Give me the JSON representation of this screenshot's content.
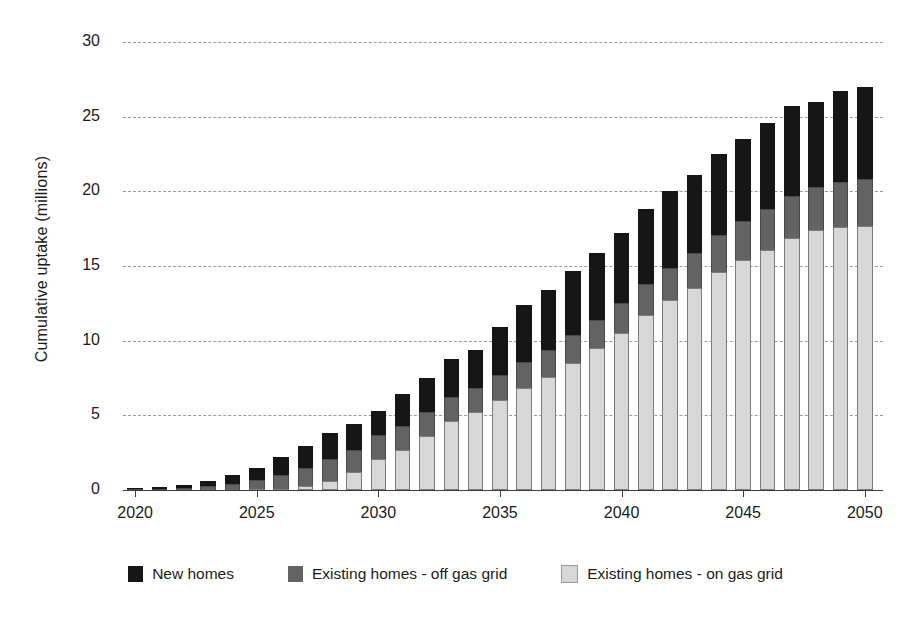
{
  "chart_data": {
    "type": "bar",
    "stacked": true,
    "title": "",
    "xlabel": "",
    "ylabel": "Cumulative uptake (millions)",
    "ylim": [
      0,
      30
    ],
    "ytick_step": 5,
    "yticks": [
      0,
      5,
      10,
      15,
      20,
      25,
      30
    ],
    "grid": true,
    "xtick_labels": [
      "2020",
      "2025",
      "2030",
      "2035",
      "2040",
      "2045",
      "2050"
    ],
    "xtick_years": [
      2020,
      2025,
      2030,
      2035,
      2040,
      2045,
      2050
    ],
    "legend_position": "bottom",
    "categories": [
      2020,
      2021,
      2022,
      2023,
      2024,
      2025,
      2026,
      2027,
      2028,
      2029,
      2030,
      2031,
      2032,
      2033,
      2034,
      2035,
      2036,
      2037,
      2038,
      2039,
      2040,
      2041,
      2042,
      2043,
      2044,
      2045,
      2046,
      2047,
      2048,
      2049,
      2050
    ],
    "series": [
      {
        "name": "Existing homes - on gas grid",
        "color": "#d7d7d7",
        "values": [
          0.0,
          0.0,
          0.0,
          0.0,
          0.0,
          0.05,
          0.1,
          0.25,
          0.6,
          1.2,
          2.1,
          2.7,
          3.6,
          4.6,
          5.2,
          6.0,
          6.8,
          7.6,
          8.5,
          9.5,
          10.5,
          11.7,
          12.7,
          13.5,
          14.6,
          15.4,
          16.1,
          16.9,
          17.4,
          17.6,
          17.7
        ]
      },
      {
        "name": "Existing homes - off gas grid",
        "color": "#636363",
        "values": [
          0.05,
          0.1,
          0.15,
          0.25,
          0.4,
          0.6,
          0.9,
          1.2,
          1.5,
          1.5,
          1.6,
          1.6,
          1.6,
          1.6,
          1.6,
          1.7,
          1.8,
          1.8,
          1.9,
          1.9,
          2.0,
          2.1,
          2.2,
          2.4,
          2.5,
          2.6,
          2.7,
          2.8,
          2.9,
          3.0,
          3.1
        ]
      },
      {
        "name": "New homes",
        "color": "#161616",
        "values": [
          0.05,
          0.1,
          0.2,
          0.35,
          0.6,
          0.85,
          1.2,
          1.5,
          1.7,
          1.7,
          1.6,
          2.1,
          2.3,
          2.6,
          2.6,
          3.2,
          3.8,
          4.0,
          4.3,
          4.5,
          4.7,
          5.0,
          5.1,
          5.2,
          5.4,
          5.5,
          5.8,
          6.0,
          5.7,
          6.1,
          6.2
        ]
      }
    ],
    "totals": [
      0.1,
      0.2,
      0.35,
      0.6,
      1.0,
      1.5,
      2.2,
      2.95,
      3.8,
      4.4,
      5.3,
      6.4,
      7.5,
      8.8,
      9.4,
      10.9,
      12.4,
      13.4,
      14.7,
      15.9,
      17.2,
      18.8,
      20.0,
      21.1,
      22.5,
      23.5,
      24.6,
      25.7,
      26.0,
      26.7,
      27.0
    ]
  },
  "legend": {
    "items": [
      {
        "label": "New homes",
        "swatch": "black-square-swatch"
      },
      {
        "label": "Existing homes - off gas grid",
        "swatch": "dark-gray-square-swatch"
      },
      {
        "label": "Existing homes - on gas grid",
        "swatch": "light-gray-square-swatch"
      }
    ]
  }
}
